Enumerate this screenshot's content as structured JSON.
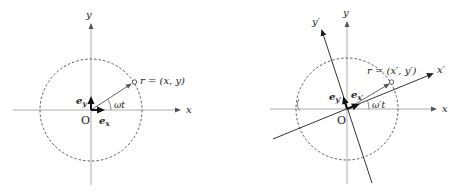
{
  "left_diagram": {
    "axis_x_label": "x",
    "axis_y_label": "y",
    "origin_label": "O",
    "basis_x_label": "e",
    "basis_x_sub": "x",
    "basis_y_label": "e",
    "basis_y_sub": "y",
    "angle_label": "ωt",
    "position_label": "r = (x, y)"
  },
  "right_diagram": {
    "axis_x_label": "x",
    "axis_y_label": "y",
    "axis_xp_label": "x′",
    "axis_yp_label": "y′",
    "origin_label": "O",
    "basis_xp_label": "e",
    "basis_xp_sub": "x′",
    "basis_yp_label": "e",
    "basis_yp_sub": "y′",
    "angle_label": "ω′t",
    "position_label": "r = (x′, y′)"
  },
  "colors": {
    "axis": "#999999",
    "rotated_axis": "#333333",
    "circle": "#333333",
    "vector": "#555555",
    "basis": "#111111"
  }
}
